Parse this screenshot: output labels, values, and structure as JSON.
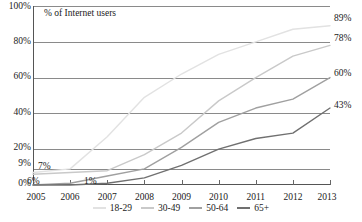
{
  "chart_data": {
    "type": "line",
    "title": "% of Internet users",
    "xlabel": "",
    "ylabel": "",
    "ylim": [
      0,
      100
    ],
    "grid": true,
    "legend_position": "bottom",
    "x": [
      "2005",
      "2006",
      "2007",
      "2008",
      "2009",
      "2010",
      "2011",
      "2012",
      "2013"
    ],
    "y_ticks": [
      "0%",
      "9%",
      "20%",
      "40%",
      "60%",
      "80%",
      "100%"
    ],
    "y_tick_values": [
      0,
      9,
      20,
      40,
      60,
      80,
      100
    ],
    "series": [
      {
        "name": "18-29",
        "color": "#e2e2e2",
        "values": [
          7,
          9,
          27,
          49,
          62,
          73,
          80,
          87,
          89
        ],
        "end_label": "89%",
        "start_label": "7%"
      },
      {
        "name": "30-49",
        "color": "#c9c9c9",
        "values": [
          6,
          7,
          8,
          17,
          29,
          47,
          60,
          72,
          78
        ],
        "end_label": "78%",
        "start_label": "6%"
      },
      {
        "name": "50-64",
        "color": "#a0a0a0",
        "values": [
          0,
          1,
          5,
          9,
          21,
          35,
          43,
          48,
          60
        ],
        "end_label": "60%",
        "start_label": "1%"
      },
      {
        "name": "65+",
        "color": "#707070",
        "values": [
          0,
          0,
          1,
          4,
          11,
          20,
          26,
          29,
          43
        ],
        "end_label": "43%",
        "start_label": ""
      }
    ],
    "inline_labels": [
      {
        "text": "7%",
        "series": "18-29"
      },
      {
        "text": "6%",
        "series": "30-49"
      },
      {
        "text": "1%",
        "series": "50-64"
      }
    ],
    "end_labels": [
      "89%",
      "78%",
      "60%",
      "43%"
    ]
  },
  "legend": {
    "items": [
      {
        "label": "18-29",
        "color": "#e2e2e2"
      },
      {
        "label": "30-49",
        "color": "#c9c9c9"
      },
      {
        "label": "50-64",
        "color": "#a0a0a0"
      },
      {
        "label": "65+",
        "color": "#707070"
      }
    ]
  },
  "axes": {
    "y_labels": [
      "100%",
      "80%",
      "60%",
      "40%",
      "20%",
      "9%",
      "0%"
    ],
    "x_labels": [
      "2005",
      "2006",
      "2007",
      "2008",
      "2009",
      "2010",
      "2011",
      "2012",
      "2013"
    ]
  }
}
